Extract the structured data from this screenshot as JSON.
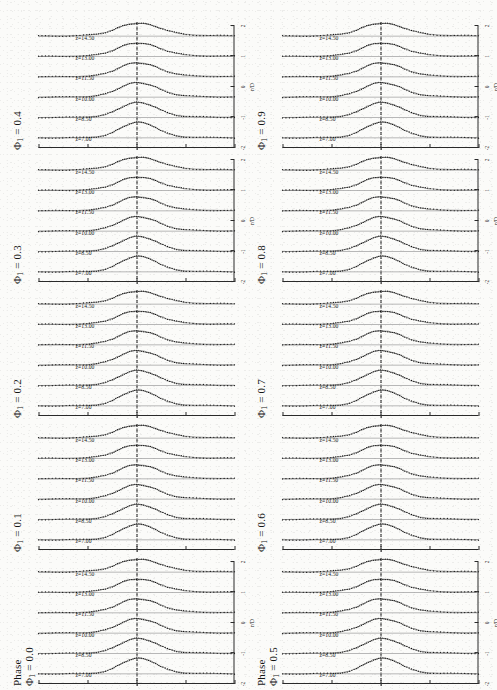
{
  "figure": {
    "quantity_label": "Phase",
    "x_axis_label": "r/D",
    "x_ticks": [
      "-2",
      "-1",
      "0",
      "1",
      "2"
    ],
    "y_ticks": [
      "-180",
      "-90",
      "0",
      "90",
      "180"
    ],
    "series_labels": [
      "z=14.50",
      "z=13.00",
      "z=11.50",
      "z=10.00",
      "z=8.50",
      "z=7.00"
    ],
    "panels": [
      {
        "id": "phi-0-0",
        "label": "Φ",
        "sub": "1",
        "eq": "= 0.0",
        "show_phase_word": true,
        "show_axes": true
      },
      {
        "id": "phi-0-1",
        "label": "Φ",
        "sub": "1",
        "eq": "= 0.1",
        "show_phase_word": false,
        "show_axes": false
      },
      {
        "id": "phi-0-2",
        "label": "Φ",
        "sub": "1",
        "eq": "= 0.2",
        "show_phase_word": false,
        "show_axes": false
      },
      {
        "id": "phi-0-3",
        "label": "Φ",
        "sub": "1",
        "eq": "= 0.3",
        "show_phase_word": false,
        "show_axes": true
      },
      {
        "id": "phi-0-4",
        "label": "Φ",
        "sub": "1",
        "eq": "= 0.4",
        "show_phase_word": false,
        "show_axes": true
      },
      {
        "id": "phi-0-5",
        "label": "Φ",
        "sub": "1",
        "eq": "= 0.5",
        "show_phase_word": true,
        "show_axes": true
      },
      {
        "id": "phi-0-6",
        "label": "Φ",
        "sub": "1",
        "eq": "= 0.6",
        "show_phase_word": false,
        "show_axes": false
      },
      {
        "id": "phi-0-7",
        "label": "Φ",
        "sub": "1",
        "eq": "= 0.7",
        "show_phase_word": false,
        "show_axes": false
      },
      {
        "id": "phi-0-8",
        "label": "Φ",
        "sub": "1",
        "eq": "= 0.8",
        "show_phase_word": false,
        "show_axes": true
      },
      {
        "id": "phi-0-9",
        "label": "Φ",
        "sub": "1",
        "eq": "= 0.9",
        "show_phase_word": false,
        "show_axes": true
      }
    ]
  },
  "chart_data": {
    "type": "line",
    "xlabel": "r/D",
    "ylabel": "Phase",
    "xlim": [
      -2.4,
      2.4
    ],
    "ylim": [
      -200,
      200
    ],
    "grid": false,
    "legend": "inline-series-labels",
    "panel_variable": "Φ_1",
    "panel_values": [
      0.0,
      0.1,
      0.2,
      0.3,
      0.4,
      0.5,
      0.6,
      0.7,
      0.8,
      0.9
    ],
    "offset_variable": "z",
    "offset_values": [
      14.5,
      13.0,
      11.5,
      10.0,
      8.5,
      7.0
    ],
    "x": [
      -2.4,
      -2.1,
      -1.8,
      -1.5,
      -1.2,
      -1.0,
      -0.8,
      -0.6,
      -0.45,
      -0.3,
      -0.15,
      0.0,
      0.15,
      0.3,
      0.45,
      0.6,
      0.8,
      1.0,
      1.2,
      1.5,
      1.8,
      2.1,
      2.4
    ],
    "series": [
      {
        "name": "z=14.50",
        "values": [
          -5,
          -6,
          -8,
          -12,
          -22,
          -38,
          -62,
          -95,
          -120,
          -140,
          -152,
          -155,
          -148,
          -128,
          -100,
          -70,
          -40,
          -22,
          -12,
          -6,
          -3,
          -2,
          -1
        ]
      },
      {
        "name": "z=13.00",
        "values": [
          -4,
          -5,
          -7,
          -11,
          -20,
          -36,
          -60,
          -94,
          -122,
          -144,
          -158,
          -162,
          -154,
          -132,
          -102,
          -70,
          -38,
          -20,
          -10,
          -5,
          -3,
          -2,
          -1
        ]
      },
      {
        "name": "z=11.50",
        "values": [
          -4,
          -5,
          -7,
          -10,
          -18,
          -33,
          -58,
          -92,
          -124,
          -148,
          -164,
          -170,
          -160,
          -136,
          -104,
          -68,
          -36,
          -18,
          -9,
          -4,
          -2,
          -1,
          -1
        ]
      },
      {
        "name": "z=10.00",
        "values": [
          -3,
          -4,
          -6,
          -9,
          -16,
          -30,
          -54,
          -90,
          -126,
          -152,
          -170,
          -176,
          -164,
          -138,
          -104,
          -66,
          -34,
          -16,
          -8,
          -4,
          -2,
          -1,
          0
        ]
      },
      {
        "name": "z=8.50",
        "values": [
          -3,
          -4,
          -5,
          -8,
          -14,
          -26,
          -50,
          -88,
          -128,
          -158,
          -176,
          -182,
          -168,
          -140,
          -102,
          -62,
          -30,
          -14,
          -7,
          -3,
          -2,
          -1,
          0
        ]
      },
      {
        "name": "z=7.00",
        "values": [
          -2,
          -3,
          -4,
          -6,
          -11,
          -22,
          -46,
          -86,
          -132,
          -164,
          -182,
          -188,
          -172,
          -142,
          -100,
          -58,
          -26,
          -11,
          -5,
          -3,
          -1,
          -1,
          0
        ]
      }
    ],
    "marker_style": "dotted-measurement",
    "line_style": "solid-model",
    "reference_line": {
      "orientation": "horizontal",
      "value": 0,
      "style": "dash-dot"
    }
  }
}
